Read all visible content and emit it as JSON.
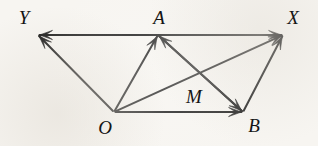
{
  "figure": {
    "background_color": "#f7f5f1",
    "ink_color": "#121212",
    "width": 318,
    "height": 146
  },
  "points": {
    "Y": {
      "label": "Y",
      "x": 38,
      "y": 35,
      "label_x": 24,
      "label_y": 17
    },
    "A": {
      "label": "A",
      "x": 158,
      "y": 35,
      "label_x": 159,
      "label_y": 17
    },
    "X": {
      "label": "X",
      "x": 283,
      "y": 35,
      "label_x": 293,
      "label_y": 17
    },
    "O": {
      "label": "O",
      "x": 114,
      "y": 112,
      "label_x": 105,
      "label_y": 127
    },
    "B": {
      "label": "B",
      "x": 243,
      "y": 112,
      "label_x": 254,
      "label_y": 125
    },
    "M": {
      "label": "M",
      "x": 196,
      "y": 78,
      "label_x": 194,
      "label_y": 96
    }
  },
  "edges": [
    {
      "name": "segment-Y-X",
      "from": "Y",
      "to": "X",
      "arrow_at_start": true,
      "arrow_at_end": true
    },
    {
      "name": "segment-O-Y",
      "from": "O",
      "to": "Y",
      "arrow_at_start": false,
      "arrow_at_end": true
    },
    {
      "name": "segment-O-A",
      "from": "O",
      "to": "A",
      "arrow_at_start": false,
      "arrow_at_end": true
    },
    {
      "name": "segment-O-X",
      "from": "O",
      "to": "X",
      "arrow_at_start": false,
      "arrow_at_end": true
    },
    {
      "name": "segment-O-B",
      "from": "O",
      "to": "B",
      "arrow_at_start": false,
      "arrow_at_end": true
    },
    {
      "name": "segment-A-B",
      "from": "A",
      "to": "B",
      "arrow_at_start": false,
      "arrow_at_end": true
    },
    {
      "name": "segment-B-A",
      "from": "B",
      "to": "A",
      "arrow_at_start": false,
      "arrow_at_end": true
    },
    {
      "name": "segment-B-X",
      "from": "B",
      "to": "X",
      "arrow_at_start": false,
      "arrow_at_end": true
    }
  ],
  "annotations": {
    "intersection_note": "M marks the crossing of segment O-X and segment A-B"
  }
}
